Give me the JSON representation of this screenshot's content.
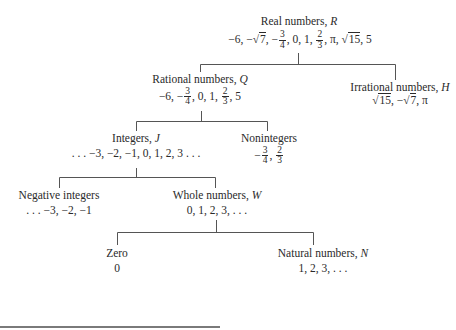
{
  "diagram": {
    "type": "tree",
    "nodes": {
      "real": {
        "label": "Real numbers, ",
        "symbol": "R",
        "values": [
          "−6, −",
          "√",
          "7",
          ", −",
          "3",
          "4",
          ", 0, 1, ",
          "2",
          "3",
          ", π, ",
          "√",
          "15",
          ", 5"
        ]
      },
      "rational": {
        "label": "Rational numbers, ",
        "symbol": "Q",
        "values": [
          "−6, −",
          "3",
          "4",
          ", 0, 1, ",
          "2",
          "3",
          ", 5"
        ]
      },
      "irrational": {
        "label": "Irrational numbers, ",
        "symbol": "H",
        "values": [
          "√",
          "15",
          ", −",
          "√",
          "7",
          ", π"
        ]
      },
      "integers": {
        "label": "Integers, ",
        "symbol": "J",
        "values": ". . . −3, −2, −1, 0, 1, 2, 3 . . ."
      },
      "nonintegers": {
        "label": "Nonintegers",
        "values": [
          "−",
          "3",
          "4",
          ", ",
          "2",
          "3"
        ]
      },
      "negative": {
        "label": "Negative integers",
        "values": ". . . −3, −2, −1"
      },
      "whole": {
        "label": "Whole numbers, ",
        "symbol": "W",
        "values": "0, 1, 2, 3, . . ."
      },
      "zero": {
        "label": "Zero",
        "values": "0"
      },
      "natural": {
        "label": "Natural numbers, ",
        "symbol": "N",
        "values": "1, 2, 3, . . ."
      }
    },
    "edges": [
      [
        "real",
        "rational"
      ],
      [
        "real",
        "irrational"
      ],
      [
        "rational",
        "integers"
      ],
      [
        "rational",
        "nonintegers"
      ],
      [
        "integers",
        "negative"
      ],
      [
        "integers",
        "whole"
      ],
      [
        "whole",
        "zero"
      ],
      [
        "whole",
        "natural"
      ]
    ],
    "line_color": "#555555"
  }
}
